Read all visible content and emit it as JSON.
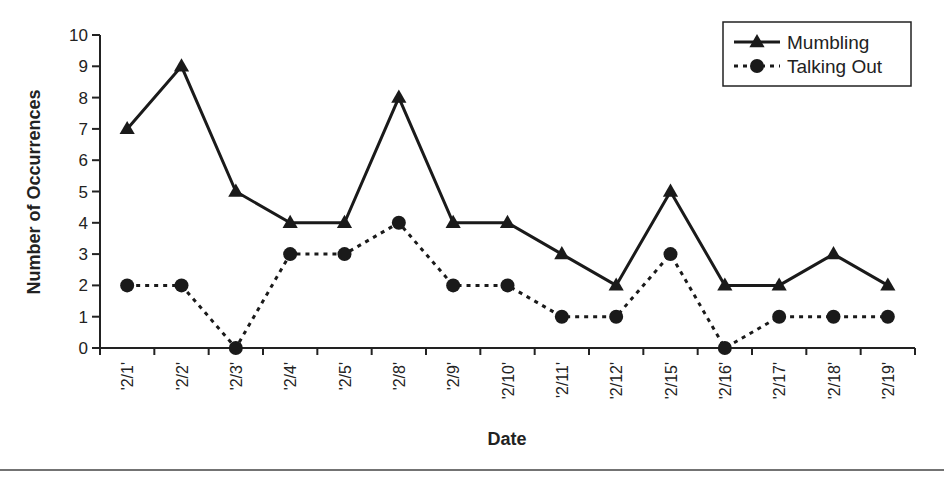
{
  "chart_data": {
    "type": "line",
    "title": "",
    "xlabel": "Date",
    "ylabel": "Number of Occurrences",
    "ylim": [
      0,
      10
    ],
    "yticks": [
      0,
      1,
      2,
      3,
      4,
      5,
      6,
      7,
      8,
      9,
      10
    ],
    "grid": false,
    "legend_position": "upper right",
    "categories": [
      "'2/1'",
      "'2/2'",
      "'2/3'",
      "'2/4'",
      "'2/5'",
      "'2/8'",
      "'2/9'",
      "'2/10'",
      "'2/11'",
      "'2/12'",
      "'2/15'",
      "'2/16'",
      "'2/17'",
      "'2/18'",
      "'2/19'"
    ],
    "series": [
      {
        "name": "Mumbling",
        "style": "solid",
        "marker": "triangle",
        "values": [
          7,
          9,
          5,
          4,
          4,
          8,
          4,
          4,
          3,
          2,
          5,
          2,
          2,
          3,
          2
        ]
      },
      {
        "name": "Talking Out",
        "style": "dotted",
        "marker": "circle",
        "values": [
          2,
          2,
          0,
          3,
          3,
          4,
          2,
          2,
          1,
          1,
          3,
          0,
          1,
          1,
          1
        ]
      }
    ]
  },
  "colors": {
    "line": "#1a1a1a",
    "axis": "#222222"
  }
}
